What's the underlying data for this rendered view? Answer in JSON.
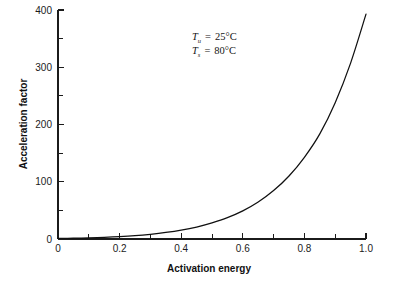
{
  "chart_data": {
    "type": "line",
    "title": "",
    "xlabel": "Activation energy",
    "ylabel": "Acceleration factor",
    "xlim": [
      0,
      1.0
    ],
    "ylim": [
      0,
      440
    ],
    "grid": false,
    "legend": null,
    "x_ticks": [
      "0",
      "0.2",
      "0.4",
      "0.6",
      "0.8",
      "1.0"
    ],
    "x_tick_values": [
      0,
      0.2,
      0.4,
      0.6,
      0.8,
      1.0
    ],
    "x_minor_tick_values": [
      0.1,
      0.3,
      0.5,
      0.7,
      0.9
    ],
    "y_ticks": [
      "0",
      "100",
      "200",
      "300",
      "400"
    ],
    "y_tick_values": [
      0,
      100,
      200,
      300,
      400
    ],
    "y_minor_tick_values": [
      50,
      150,
      250,
      350
    ],
    "series": [
      {
        "name": "Acceleration factor",
        "x": [
          0.0,
          0.05,
          0.1,
          0.15,
          0.2,
          0.25,
          0.3,
          0.35,
          0.4,
          0.45,
          0.5,
          0.55,
          0.6,
          0.65,
          0.7,
          0.75,
          0.8,
          0.85,
          0.9,
          0.95,
          1.0
        ],
        "values": [
          1.0,
          1.4,
          2.1,
          3.0,
          4.3,
          6.2,
          8.9,
          12.8,
          18.4,
          26.4,
          37.9,
          54.4,
          78.1,
          112.1,
          160.9,
          231.0,
          331.6,
          476.0,
          683.3,
          980.8,
          430.0
        ]
      }
    ],
    "curve_points": [
      [
        0.0,
        1.0
      ],
      [
        0.05,
        1.5
      ],
      [
        0.1,
        2.2
      ],
      [
        0.15,
        3.1
      ],
      [
        0.2,
        4.4
      ],
      [
        0.25,
        6.3
      ],
      [
        0.3,
        9.0
      ],
      [
        0.35,
        12.5
      ],
      [
        0.4,
        17.0
      ],
      [
        0.45,
        23.0
      ],
      [
        0.5,
        31.0
      ],
      [
        0.55,
        41.0
      ],
      [
        0.6,
        54.0
      ],
      [
        0.65,
        71.0
      ],
      [
        0.7,
        93.0
      ],
      [
        0.75,
        121.0
      ],
      [
        0.8,
        157.0
      ],
      [
        0.85,
        202.0
      ],
      [
        0.9,
        262.0
      ],
      [
        0.95,
        338.0
      ],
      [
        1.0,
        432.0
      ]
    ],
    "annotations": [
      {
        "id": "use-temperature",
        "symbol": "T",
        "subscript": "u",
        "equals": "=",
        "value": "25°C",
        "full_text": "Tu = 25°C"
      },
      {
        "id": "stress-temperature",
        "symbol": "T",
        "subscript": "s",
        "equals": "=",
        "value": "80°C",
        "full_text": "Ts = 80°C"
      }
    ],
    "colors": {
      "curve": "#101010",
      "axis": "#1b1b1b",
      "text": "#141414",
      "background": "#ffffff"
    }
  }
}
